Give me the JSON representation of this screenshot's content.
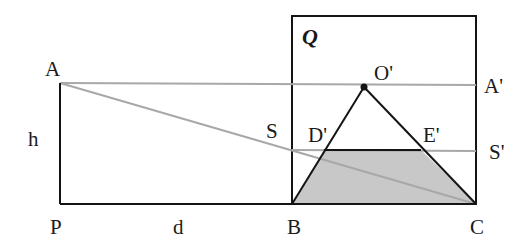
{
  "diagram": {
    "colors": {
      "stroke": "#141414",
      "guide": "#a8a8a8",
      "fill": "#c8c8c8",
      "background": "#ffffff"
    },
    "points": {
      "A": {
        "x": 60,
        "y": 83
      },
      "P": {
        "x": 60,
        "y": 204
      },
      "B": {
        "x": 292,
        "y": 204
      },
      "C": {
        "x": 476,
        "y": 204
      },
      "O'": {
        "x": 364,
        "y": 87
      },
      "D'": {
        "x": 324,
        "y": 150
      },
      "E'": {
        "x": 421,
        "y": 150
      },
      "S": {
        "x": 292,
        "y": 150
      },
      "S'": {
        "x": 476,
        "y": 151
      },
      "A'": {
        "x": 476,
        "y": 85
      }
    },
    "frame_Q": {
      "x": 292,
      "y": 16,
      "width": 184,
      "height": 188
    },
    "labels": {
      "A": "A",
      "P": "P",
      "B": "B",
      "C": "C",
      "O_prime": "O'",
      "D_prime": "D'",
      "E_prime": "E'",
      "S": "S",
      "S_prime": "S'",
      "A_prime": "A'",
      "h": "h",
      "d": "d",
      "Q": "Q"
    }
  }
}
